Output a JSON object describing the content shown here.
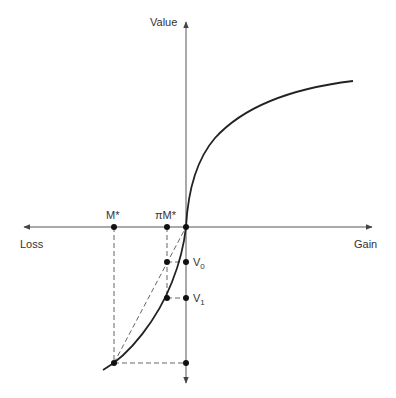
{
  "diagram": {
    "type": "prospect-theory-value-function",
    "axis_labels": {
      "y": "Value",
      "x_pos": "Gain",
      "x_neg": "Loss"
    },
    "points": {
      "m_star": "M*",
      "pi_m_star": "πM*",
      "v0": "V",
      "v0_sub": "0",
      "v1": "V",
      "v1_sub": "1"
    },
    "colors": {
      "curve": "#222222",
      "axis": "#555555",
      "dash": "#666666",
      "dot": "#111111"
    }
  }
}
